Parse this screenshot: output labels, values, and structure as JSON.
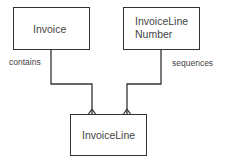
{
  "diagram": {
    "type": "entity-relationship",
    "entities": [
      {
        "id": "invoice",
        "name": "Invoice",
        "lines": [
          "Invoice"
        ]
      },
      {
        "id": "invoiceline_number",
        "name": "InvoiceLine Number",
        "lines": [
          "InvoiceLine",
          "Number"
        ]
      },
      {
        "id": "invoiceline",
        "name": "InvoiceLine",
        "lines": [
          "InvoiceLine"
        ]
      }
    ],
    "relationships": [
      {
        "from": "invoice",
        "to": "invoiceline",
        "label": "contains",
        "cardinality_to": "many"
      },
      {
        "from": "invoiceline_number",
        "to": "invoiceline",
        "label": "sequences",
        "cardinality_to": "many"
      }
    ],
    "colors": {
      "line": "#333333",
      "text": "#444444",
      "background": "#ffffff"
    }
  }
}
